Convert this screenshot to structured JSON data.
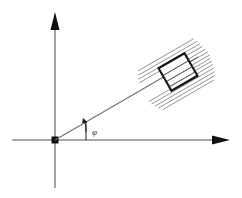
{
  "figure": {
    "background_color": "#ffffff",
    "width": 242,
    "height": 198
  },
  "colors": {
    "axis": "#8a8a8a",
    "arrowhead": "#111111",
    "ray": "#6f6f6f",
    "hatch": "#8d8d8d",
    "block_outline": "#161616",
    "block_fill": "#ffffff",
    "label": "#1b1b1b"
  },
  "axes": {
    "vertical": {
      "label": "",
      "icon": "axis-arrow-up-icon",
      "x": 55,
      "y_top": 16,
      "y_bottom": 188,
      "arrow_direction": "up"
    },
    "horizontal": {
      "label": "",
      "icon": "axis-arrow-right-icon",
      "y": 140,
      "x_left": 12,
      "x_right": 228,
      "arrow_direction": "right"
    },
    "origin": {
      "label": "",
      "x": 55,
      "y": 140,
      "marker": "filled-dot"
    }
  },
  "ray": {
    "label": "",
    "start_x": 55,
    "start_y": 140,
    "end_x": 196,
    "end_y": 58,
    "angle_degrees": 30
  },
  "angle_marker": {
    "label": "φ",
    "label_name": "phi",
    "label_x": 92,
    "label_y": 133,
    "arc_radius": 36,
    "arc_start_degrees": 0,
    "arc_end_degrees": 30,
    "vertex_x": 55,
    "vertex_y": 140
  },
  "block": {
    "label": "",
    "center_x": 178,
    "center_y": 72,
    "width": 30,
    "height": 26,
    "rotation_degrees": -30,
    "inner_line_count": 3
  },
  "hatching": {
    "label": "",
    "line_count": 9,
    "angle_degrees": -30,
    "description": "parallel stripes aligned with the ray passing through the block"
  }
}
